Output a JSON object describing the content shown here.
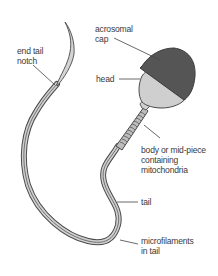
{
  "diagram": {
    "labels": {
      "acrosomal_cap": [
        "acrosomal",
        "cap"
      ],
      "head": [
        "head"
      ],
      "end_tail_notch": [
        "end tail",
        "notch"
      ],
      "body": [
        "body or mid-piece",
        "containing",
        "mitochondria"
      ],
      "tail": [
        "tail"
      ],
      "microfilaments": [
        "microfilaments",
        "in tail"
      ]
    },
    "colors": {
      "cap": "#555555",
      "head": "#cfcfcf",
      "outline": "#4a4a4a",
      "tail_fill": "#c8c8c8",
      "leader": "#444444",
      "text": "#3a3a3a"
    }
  }
}
